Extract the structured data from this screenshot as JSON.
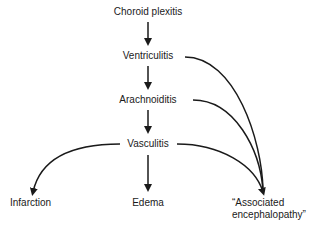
{
  "diagram": {
    "nodes": {
      "choroid_plexitis": "Choroid plexitis",
      "ventriculitis": "Ventriculitis",
      "arachnoiditis": "Arachnoiditis",
      "vasculitis": "Vasculitis",
      "infarction": "Infarction",
      "edema": "Edema",
      "associated_line1": "“Associated",
      "associated_line2": "encephalopathy”"
    },
    "edges": [
      {
        "from": "Choroid plexitis",
        "to": "Ventriculitis"
      },
      {
        "from": "Ventriculitis",
        "to": "Arachnoiditis"
      },
      {
        "from": "Arachnoiditis",
        "to": "Vasculitis"
      },
      {
        "from": "Vasculitis",
        "to": "Infarction"
      },
      {
        "from": "Vasculitis",
        "to": "Edema"
      },
      {
        "from": "Vasculitis",
        "to": "Associated encephalopathy"
      },
      {
        "from": "Arachnoiditis",
        "to": "Associated encephalopathy"
      },
      {
        "from": "Ventriculitis",
        "to": "Associated encephalopathy"
      }
    ],
    "colors": {
      "line": "#1a1a1a",
      "background": "#ffffff"
    }
  }
}
